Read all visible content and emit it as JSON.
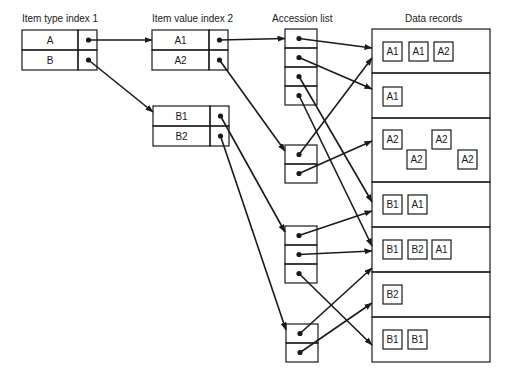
{
  "headings": {
    "item_type_index": "Item type index 1",
    "item_value_index": "Item value index 2",
    "accession_list": "Accession list",
    "data_records": "Data records"
  },
  "item_type_index": {
    "rows": [
      "A",
      "B"
    ]
  },
  "item_value_index": {
    "groups": [
      {
        "rows": [
          "A1",
          "A2"
        ],
        "from": "A"
      },
      {
        "rows": [
          "B1",
          "B2"
        ],
        "from": "B"
      }
    ]
  },
  "accession_list": {
    "groups": [
      {
        "from": "A1",
        "slots": 4
      },
      {
        "from": "A2",
        "slots": 2
      },
      {
        "from": "B1",
        "slots": 3
      },
      {
        "from": "B2",
        "slots": 2
      }
    ]
  },
  "data_records": [
    {
      "items": [
        "A1",
        "A1",
        "A2"
      ]
    },
    {
      "items": [
        "A1"
      ]
    },
    {
      "items": [
        "A2",
        "A2",
        "A2",
        "A2"
      ]
    },
    {
      "items": [
        "B1",
        "A1"
      ]
    },
    {
      "items": [
        "B1",
        "B2",
        "A1"
      ]
    },
    {
      "items": [
        "B2"
      ]
    },
    {
      "items": [
        "B1",
        "B1"
      ]
    }
  ],
  "pointers": [
    {
      "from": "accession-1-slot-1",
      "to": "record-1"
    },
    {
      "from": "accession-1-slot-2",
      "to": "record-2"
    },
    {
      "from": "accession-1-slot-3",
      "to": "record-4"
    },
    {
      "from": "accession-1-slot-4",
      "to": "record-5"
    },
    {
      "from": "accession-2-slot-1",
      "to": "record-1"
    },
    {
      "from": "accession-2-slot-2",
      "to": "record-3"
    },
    {
      "from": "accession-3-slot-1",
      "to": "record-4"
    },
    {
      "from": "accession-3-slot-2",
      "to": "record-5"
    },
    {
      "from": "accession-3-slot-3",
      "to": "record-7"
    },
    {
      "from": "accession-4-slot-1",
      "to": "record-5"
    },
    {
      "from": "accession-4-slot-2",
      "to": "record-6"
    }
  ],
  "colors": {
    "ink": "#1a1a1a",
    "background": "#ffffff"
  }
}
